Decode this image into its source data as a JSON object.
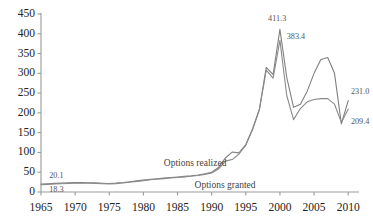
{
  "chart_data": {
    "type": "line",
    "title": "",
    "subtitle": "",
    "xlabel": "",
    "ylabel": "",
    "xlim": [
      1965,
      2011
    ],
    "ylim": [
      0,
      450
    ],
    "grid": false,
    "legend_position": "inline-annotations",
    "x_ticks": [
      "1965",
      "1970",
      "1975",
      "1980",
      "1985",
      "1990",
      "1995",
      "2000",
      "2005",
      "2010"
    ],
    "y_ticks": [
      "0",
      "50",
      "100",
      "150",
      "200",
      "250",
      "300",
      "350",
      "400",
      "450"
    ],
    "x": [
      1965,
      1966,
      1967,
      1968,
      1969,
      1970,
      1971,
      1972,
      1973,
      1974,
      1975,
      1976,
      1977,
      1978,
      1979,
      1980,
      1981,
      1982,
      1983,
      1984,
      1985,
      1986,
      1987,
      1988,
      1989,
      1990,
      1991,
      1992,
      1993,
      1994,
      1995,
      1996,
      1997,
      1998,
      1999,
      2000,
      2001,
      2002,
      2003,
      2004,
      2005,
      2006,
      2007,
      2008,
      2009,
      2010
    ],
    "series": [
      {
        "name": "Options realized",
        "color": "#808080",
        "values": [
          20.1,
          21.0,
          21.8,
          22.5,
          23.2,
          23.6,
          23.8,
          23.5,
          23.0,
          22.3,
          21.6,
          22.5,
          24.0,
          26.0,
          28.0,
          30.0,
          32.0,
          33.5,
          35.0,
          36.5,
          38.0,
          39.5,
          41.0,
          43.0,
          46.0,
          50.0,
          62.0,
          86.0,
          101.0,
          99.0,
          120.0,
          160.0,
          210.0,
          315.0,
          297.0,
          411.3,
          290.0,
          214.0,
          222.0,
          255.0,
          300.0,
          335.0,
          340.0,
          300.0,
          172.0,
          231.0
        ]
      },
      {
        "name": "Options granted",
        "color": "#8a8a8a",
        "values": [
          18.3,
          19.3,
          20.2,
          21.0,
          21.6,
          22.0,
          22.2,
          22.0,
          21.5,
          21.0,
          20.4,
          21.2,
          22.8,
          24.8,
          26.8,
          28.8,
          30.8,
          32.3,
          33.8,
          35.3,
          36.8,
          38.3,
          39.8,
          41.8,
          44.5,
          48.0,
          58.0,
          78.0,
          82.0,
          96.0,
          118.0,
          158.0,
          208.0,
          308.0,
          288.0,
          383.4,
          244.0,
          183.0,
          211.0,
          228.0,
          234.0,
          236.0,
          236.0,
          222.0,
          176.0,
          209.4
        ]
      }
    ],
    "annotations": [
      {
        "id": "start-realized",
        "text": "20.1",
        "x": 1966.2,
        "y": 40,
        "anchor": "start"
      },
      {
        "id": "start-granted",
        "text": "18.3",
        "x": 1966.2,
        "y": 6,
        "anchor": "start"
      },
      {
        "id": "peak-realized",
        "text": "411.3",
        "x": 1999.6,
        "y": 437,
        "anchor": "middle"
      },
      {
        "id": "peak-granted",
        "text": "383.4",
        "x": 2001.0,
        "y": 392,
        "anchor": "start"
      },
      {
        "id": "end-realized",
        "text": "231.0",
        "x": 2010.4,
        "y": 253,
        "anchor": "start"
      },
      {
        "id": "end-granted",
        "text": "209.4",
        "x": 2010.4,
        "y": 178,
        "anchor": "start"
      }
    ],
    "series_labels": [
      {
        "id": "label-options-realized",
        "text": "Options realized",
        "x": 1983.0,
        "y": 72
      },
      {
        "id": "label-options-granted",
        "text": "Options granted",
        "x": 1987.5,
        "y": 16
      }
    ]
  }
}
